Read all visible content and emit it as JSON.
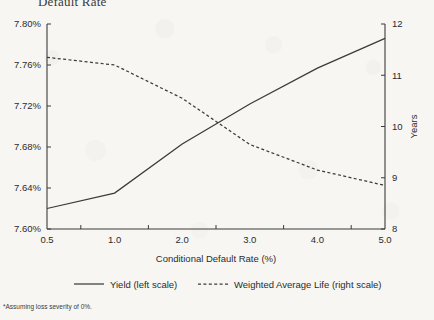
{
  "title": "Default Rate",
  "footnote": "*Assuming loss severity of 0%.",
  "axes": {
    "xlabel": "Conditional Default Rate (%)",
    "ylabel_right": "Years",
    "ylabel_left": ""
  },
  "legend": {
    "items": [
      {
        "label": "Yield (left scale)",
        "style": "solid"
      },
      {
        "label": "Weighted Average Life (right scale)",
        "style": "dashed"
      }
    ]
  },
  "chart_data": {
    "type": "line",
    "title": "Default Rate",
    "xlabel": "Conditional Default Rate (%)",
    "ylabel": "",
    "categories": [
      "0.5",
      "1.0",
      "2.0",
      "3.0",
      "4.0",
      "5.0"
    ],
    "x_positions": [
      0,
      1,
      2,
      3,
      4,
      5
    ],
    "grid": false,
    "legend_position": "bottom",
    "axis_left": {
      "label": "",
      "ticks": [
        "7.60%",
        "7.64%",
        "7.68%",
        "7.72%",
        "7.76%",
        "7.80%"
      ],
      "tick_values": [
        7.6,
        7.64,
        7.68,
        7.72,
        7.76,
        7.8
      ],
      "ylim": [
        7.6,
        7.8
      ],
      "unit": "%"
    },
    "axis_right": {
      "label": "Years",
      "ticks": [
        "8",
        "9",
        "10",
        "11",
        "12"
      ],
      "tick_values": [
        8,
        9,
        10,
        11,
        12
      ],
      "ylim": [
        8,
        12
      ],
      "unit": "Years"
    },
    "series": [
      {
        "name": "Yield (left scale)",
        "axis": "left",
        "style": "solid",
        "color": "#3a3a3a",
        "values": [
          7.62,
          7.635,
          7.683,
          7.722,
          7.757,
          7.786
        ]
      },
      {
        "name": "Weighted Average Life (right scale)",
        "axis": "right",
        "style": "dashed",
        "color": "#3a3a3a",
        "values": [
          11.35,
          11.2,
          10.55,
          9.65,
          9.15,
          8.85
        ]
      }
    ],
    "annotations": [
      "*Assuming loss severity of 0%."
    ]
  }
}
